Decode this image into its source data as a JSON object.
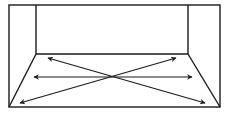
{
  "diagram": {
    "title": "",
    "stroke_color": "#1a1a1a",
    "background": "#ffffff",
    "outer_rect": {
      "x": 9,
      "y": 5,
      "w": 211,
      "h": 102
    },
    "back_wall": {
      "x1": 36,
      "y1": 5,
      "x2": 188,
      "y2": 54
    },
    "arrows": [
      {
        "name": "diagonal-up-left-to-down-right",
        "from": [
          48,
          58
        ],
        "to": [
          205,
          103
        ]
      },
      {
        "name": "horizontal",
        "from": [
          34,
          77
        ],
        "to": [
          192,
          77
        ]
      },
      {
        "name": "diagonal-down-left-to-up-right",
        "from": [
          20,
          103
        ],
        "to": [
          176,
          58
        ]
      }
    ]
  }
}
